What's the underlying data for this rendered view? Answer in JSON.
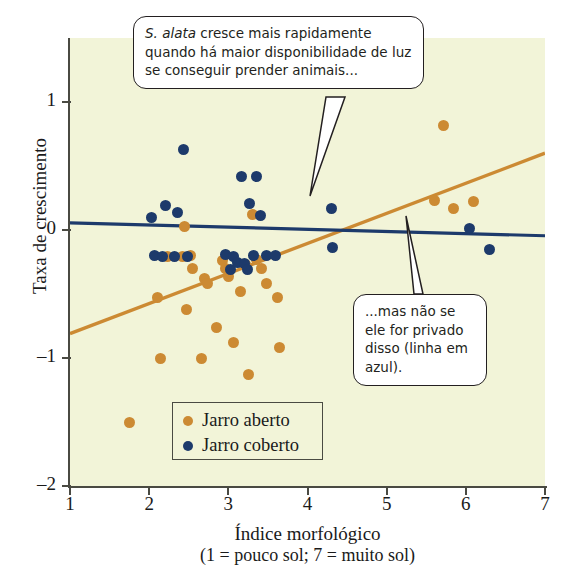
{
  "chart_data": {
    "type": "scatter",
    "title": "",
    "xlabel": "Índice morfológico",
    "xlabel_sub": "(1 = pouco sol; 7 = muito sol)",
    "ylabel": "Taxa de crescimento",
    "xlim": [
      1,
      7
    ],
    "ylim": [
      -2,
      1.5
    ],
    "xticks": [
      "1",
      "2",
      "3",
      "4",
      "5",
      "6",
      "7"
    ],
    "xtick_values": [
      1,
      2,
      3,
      4,
      5,
      6,
      7
    ],
    "yticks": [
      "1",
      "0",
      "-1",
      "-2"
    ],
    "ytick_values": [
      1,
      0,
      -1,
      -2
    ],
    "grid": false,
    "legend_position": "inside-bottom-left",
    "plot_background": "#f2f4d8",
    "colors": {
      "open": "#cc8a33",
      "closed": "#1d3a6b",
      "axis": "#4a4a42",
      "text": "#1a1a1a"
    },
    "series": [
      {
        "name": "Jarro aberto",
        "key": "open",
        "color": "#cc8a33",
        "points": [
          [
            1.75,
            -1.5
          ],
          [
            2.1,
            -0.53
          ],
          [
            2.14,
            -1.0
          ],
          [
            2.23,
            -0.21
          ],
          [
            2.42,
            -0.21
          ],
          [
            2.45,
            0.03
          ],
          [
            2.47,
            -0.62
          ],
          [
            2.52,
            -0.2
          ],
          [
            2.55,
            -0.3
          ],
          [
            2.66,
            -1.0
          ],
          [
            2.7,
            -0.38
          ],
          [
            2.74,
            -0.42
          ],
          [
            2.85,
            -0.76
          ],
          [
            2.93,
            -0.24
          ],
          [
            2.96,
            -0.3
          ],
          [
            3.0,
            -0.36
          ],
          [
            3.06,
            -0.88
          ],
          [
            3.15,
            -0.48
          ],
          [
            3.22,
            -0.27
          ],
          [
            3.26,
            -1.13
          ],
          [
            3.3,
            0.12
          ],
          [
            3.36,
            -0.23
          ],
          [
            3.42,
            -0.3
          ],
          [
            3.48,
            -0.42
          ],
          [
            3.62,
            -0.53
          ],
          [
            3.64,
            -0.92
          ],
          [
            5.6,
            0.23
          ],
          [
            5.72,
            0.82
          ],
          [
            5.85,
            0.17
          ],
          [
            6.1,
            0.22
          ]
        ]
      },
      {
        "name": "Jarro coberto",
        "key": "closed",
        "color": "#1d3a6b",
        "points": [
          [
            2.03,
            0.1
          ],
          [
            2.07,
            -0.2
          ],
          [
            2.17,
            -0.21
          ],
          [
            2.21,
            0.19
          ],
          [
            2.32,
            -0.21
          ],
          [
            2.36,
            0.14
          ],
          [
            2.43,
            0.63
          ],
          [
            2.48,
            -0.21
          ],
          [
            2.97,
            -0.19
          ],
          [
            3.03,
            -0.31
          ],
          [
            3.07,
            -0.21
          ],
          [
            3.12,
            -0.25
          ],
          [
            3.17,
            0.42
          ],
          [
            3.21,
            -0.26
          ],
          [
            3.24,
            -0.31
          ],
          [
            3.27,
            0.21
          ],
          [
            3.32,
            -0.2
          ],
          [
            3.36,
            0.42
          ],
          [
            3.4,
            0.11
          ],
          [
            3.48,
            -0.2
          ],
          [
            3.6,
            -0.2
          ],
          [
            4.3,
            0.17
          ],
          [
            4.32,
            -0.14
          ],
          [
            6.05,
            0.01
          ],
          [
            6.3,
            -0.15
          ]
        ]
      }
    ],
    "trendlines": [
      {
        "name": "Jarro aberto",
        "key": "open",
        "color": "#cc8a33",
        "x0": 1,
        "y0": -0.81,
        "x1": 7,
        "y1": 0.6
      },
      {
        "name": "Jarro coberto",
        "key": "closed",
        "color": "#1d3a6b",
        "x0": 1,
        "y0": 0.055,
        "x1": 7,
        "y1": -0.045
      }
    ],
    "annotations": [
      {
        "id": "growth",
        "text_html": "<i>S. alata</i> cresce mais rapidamente quando há maior disponibilidade de luz se conseguir prender animais...",
        "text": "S. alata cresce mais rapidamente quando há maior disponibilidade de luz se conseguir prender animais...",
        "points_to": "orange-trendline"
      },
      {
        "id": "covered",
        "text_html": "...mas não se ele for privado disso (linha em azul).",
        "text": "...mas não se ele for privado disso (linha em azul).",
        "points_to": "blue-trendline"
      }
    ]
  },
  "legend": {
    "items": [
      {
        "label": "Jarro aberto",
        "key": "open"
      },
      {
        "label": "Jarro coberto",
        "key": "closed"
      }
    ]
  }
}
